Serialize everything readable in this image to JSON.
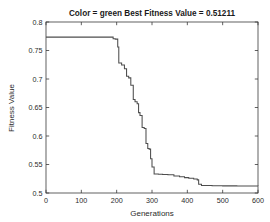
{
  "figure": {
    "background_color": "#ffffff",
    "axis_color": "#3a3a3a",
    "text_color": "#2b2b2b",
    "title_color": "#1a1a1a"
  },
  "chart_data": {
    "type": "line",
    "title": "Color = green Best Fitness Value = 0.51211",
    "xlabel": "Generations",
    "ylabel": "Fitness Value",
    "xlim": [
      0,
      600
    ],
    "ylim": [
      0.5,
      0.8
    ],
    "grid": false,
    "legend": null,
    "line_color": "#4d4d4d",
    "step_type": "post",
    "xticks": [
      0,
      100,
      200,
      300,
      400,
      500,
      600
    ],
    "xticklabels": [
      "0",
      "100",
      "200",
      "300",
      "400",
      "500",
      "600"
    ],
    "yticks": [
      0.5,
      0.55,
      0.6,
      0.65,
      0.7,
      0.75,
      0.8
    ],
    "yticklabels": [
      "0.5",
      "0.55",
      "0.6",
      "0.65",
      "0.7",
      "0.75",
      "0.8"
    ],
    "series": [
      {
        "name": "Best fitness",
        "x": [
          0,
          183,
          190,
          196,
          203,
          206,
          214,
          222,
          228,
          234,
          240,
          247,
          252,
          258,
          262,
          266,
          272,
          278,
          283,
          288,
          292,
          296,
          300,
          306,
          318,
          330,
          345,
          362,
          378,
          392,
          404,
          418,
          428,
          432,
          440,
          470,
          500,
          540,
          600
        ],
        "y": [
          0.7735,
          0.7735,
          0.7705,
          0.77,
          0.756,
          0.728,
          0.7245,
          0.718,
          0.705,
          0.702,
          0.689,
          0.664,
          0.66,
          0.6565,
          0.641,
          0.636,
          0.615,
          0.613,
          0.587,
          0.578,
          0.577,
          0.56,
          0.5455,
          0.5335,
          0.533,
          0.5325,
          0.532,
          0.53,
          0.5285,
          0.527,
          0.526,
          0.5245,
          0.523,
          0.5155,
          0.513,
          0.5128,
          0.5125,
          0.5122,
          0.5121
        ]
      }
    ],
    "best_fitness_value": "0.51211",
    "color_label": "green"
  }
}
